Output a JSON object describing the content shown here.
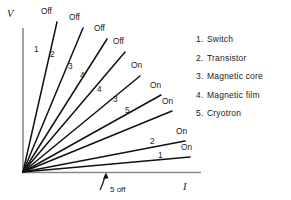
{
  "figure": {
    "axes": {
      "y_label": "V",
      "x_label": "I",
      "origin": [
        23,
        172
      ],
      "y_top": 28,
      "x_right": 201
    },
    "annotation": {
      "text": "5 off",
      "arrow_from": [
        100,
        190
      ],
      "arrow_to": [
        106,
        173
      ]
    },
    "curves": [
      {
        "id": "c1",
        "number": "1",
        "state": "Off",
        "x2": 57,
        "y2": 22,
        "num_x": 34,
        "num_y": 52,
        "state_x": 41,
        "state_y": 14
      },
      {
        "id": "c2",
        "number": "2",
        "state": "Off",
        "x2": 83,
        "y2": 28,
        "num_x": 50,
        "num_y": 57,
        "state_x": 69,
        "state_y": 20
      },
      {
        "id": "c3",
        "number": "3",
        "state": "Off",
        "x2": 107,
        "y2": 39,
        "num_x": 68,
        "num_y": 69,
        "state_x": 94,
        "state_y": 31
      },
      {
        "id": "c4",
        "number": "4",
        "state": "Off",
        "x2": 125,
        "y2": 52,
        "num_x": 80,
        "num_y": 78,
        "state_x": 113,
        "state_y": 44
      },
      {
        "id": "c5",
        "number": "4",
        "state": "On",
        "x2": 140,
        "y2": 76,
        "num_x": 97,
        "num_y": 92,
        "state_x": 131,
        "state_y": 68
      },
      {
        "id": "c6",
        "number": "3",
        "state": "On",
        "x2": 161,
        "y2": 95,
        "num_x": 113,
        "num_y": 102,
        "state_x": 150,
        "state_y": 88
      },
      {
        "id": "c7",
        "number": "5",
        "state": "On",
        "x2": 172,
        "y2": 111,
        "num_x": 125,
        "num_y": 113,
        "state_x": 162,
        "state_y": 104
      },
      {
        "id": "c8",
        "number": "2",
        "state": "On",
        "x2": 185,
        "y2": 141,
        "num_x": 150,
        "num_y": 144,
        "state_x": 176,
        "state_y": 134
      },
      {
        "id": "c9",
        "number": "1",
        "state": "On",
        "x2": 190,
        "y2": 157,
        "num_x": 158,
        "num_y": 158,
        "state_x": 181,
        "state_y": 150
      }
    ]
  },
  "legend": {
    "items": [
      {
        "num": "1.",
        "label": "Switch"
      },
      {
        "num": "2.",
        "label": "Transistor"
      },
      {
        "num": "3.",
        "label": "Magnetic core"
      },
      {
        "num": "4.",
        "label": "Magnetic film"
      },
      {
        "num": "5.",
        "label": "Cryotron"
      }
    ]
  },
  "colors": {
    "ink": "#1a1a1a",
    "axis": "#8a8a8a",
    "background": "#ffffff"
  }
}
